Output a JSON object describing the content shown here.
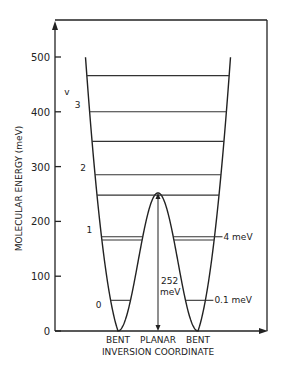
{
  "chart_data": {
    "type": "diagram",
    "title": "",
    "ylabel": "MOLECULAR ENERGY (meV)",
    "xlabel": "INVERSION COORDINATE",
    "ylim": [
      0,
      560
    ],
    "yticks": [
      0,
      100,
      200,
      300,
      400,
      500
    ],
    "x_labels": [
      "BENT",
      "PLANAR",
      "BENT"
    ],
    "barrier_height_meV": 252,
    "barrier_label": [
      "252",
      "meV"
    ],
    "v_label": "v",
    "levels": [
      {
        "energy": 56,
        "v_label": "0",
        "split_label": "0.1 meV",
        "below_barrier": true
      },
      {
        "energy": 166,
        "v_label": "",
        "below_barrier": true
      },
      {
        "energy": 172,
        "v_label": "1",
        "split_label": "4 meV",
        "below_barrier": true
      },
      {
        "energy": 248,
        "v_label": "",
        "below_barrier": false
      },
      {
        "energy": 285,
        "v_label": "2",
        "below_barrier": false
      },
      {
        "energy": 346,
        "v_label": "",
        "below_barrier": false
      },
      {
        "energy": 400,
        "v_label": "3",
        "below_barrier": false
      },
      {
        "energy": 466,
        "v_label": "",
        "below_barrier": false
      }
    ]
  }
}
